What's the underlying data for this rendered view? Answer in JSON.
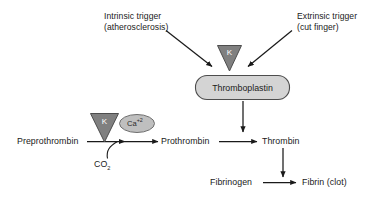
{
  "diagram": {
    "colors": {
      "line": "#1a1a1a",
      "text": "#1a1a1a",
      "triangle_fill": "#808080",
      "triangle_stroke": "#4d4d4d",
      "triangle_letter": "#ffffff",
      "box_fill": "#d4d4d4",
      "box_stroke": "#4d4d4d",
      "ellipse_fill": "#bfbfbf",
      "ellipse_stroke": "#6e6e6e",
      "background": "#ffffff"
    },
    "annotations": {
      "intrinsic_line1": "Intrinsic trigger",
      "intrinsic_line2": "(atherosclerosis)",
      "extrinsic_line1": "Extrinsic trigger",
      "extrinsic_line2": "(cut finger)"
    },
    "nodes": {
      "thromboplastin": "Thromboplastin",
      "preprothrombin": "Preprothrombin",
      "prothrombin": "Prothrombin",
      "thrombin": "Thrombin",
      "fibrinogen": "Fibrinogen",
      "fibrin": "Fibrin (clot)"
    },
    "cofactors": {
      "vitamin_k_top": "K",
      "vitamin_k_bottom": "K",
      "calcium_base": "Ca",
      "calcium_charge": "+2",
      "co2_base": "CO",
      "co2_sub": "2"
    }
  }
}
